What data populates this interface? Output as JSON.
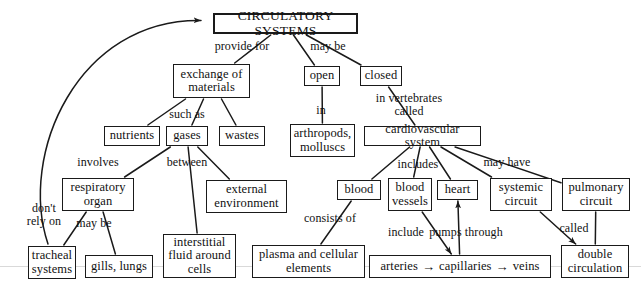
{
  "diagram": {
    "title": "CIRCULATORY SYSTEMS",
    "type": "concept-map",
    "background_color": "#ffffff",
    "line_color": "#1a1a1a",
    "text_color": "#111111"
  },
  "nodes": [
    {
      "id": "circulatory_systems",
      "label": "CIRCULATORY SYSTEMS",
      "x": 213,
      "y": 13,
      "w": 145,
      "h": 21,
      "font": 13.5,
      "title": true
    },
    {
      "id": "exchange_of_materials",
      "label": "exchange of\nmaterials",
      "x": 173,
      "y": 64,
      "w": 77,
      "h": 34,
      "font": 12.5
    },
    {
      "id": "open",
      "label": "open",
      "x": 304,
      "y": 66,
      "w": 36,
      "h": 20,
      "font": 12.5
    },
    {
      "id": "closed",
      "label": "closed",
      "x": 360,
      "y": 66,
      "w": 42,
      "h": 20,
      "font": 12.5
    },
    {
      "id": "nutrients",
      "label": "nutrients",
      "x": 104,
      "y": 126,
      "w": 56,
      "h": 20,
      "font": 12.5
    },
    {
      "id": "gases",
      "label": "gases",
      "x": 166,
      "y": 126,
      "w": 42,
      "h": 20,
      "font": 12.5
    },
    {
      "id": "wastes",
      "label": "wastes",
      "x": 219,
      "y": 126,
      "w": 46,
      "h": 20,
      "font": 12.5
    },
    {
      "id": "arthropods_molluscs",
      "label": "arthropods,\nmolluscs",
      "x": 290,
      "y": 124,
      "w": 65,
      "h": 33,
      "font": 12.5
    },
    {
      "id": "cardiovascular_system",
      "label": "cardiovascular system",
      "x": 364,
      "y": 126,
      "w": 117,
      "h": 20,
      "font": 12.5
    },
    {
      "id": "respiratory_organ",
      "label": "respiratory\norgan",
      "x": 62,
      "y": 178,
      "w": 72,
      "h": 33,
      "font": 12.5
    },
    {
      "id": "external_environment",
      "label": "external\nenvironment",
      "x": 206,
      "y": 180,
      "w": 81,
      "h": 33,
      "font": 12.5
    },
    {
      "id": "blood",
      "label": "blood",
      "x": 337,
      "y": 180,
      "w": 44,
      "h": 20,
      "font": 12.5
    },
    {
      "id": "blood_vessels",
      "label": "blood\nvessels",
      "x": 388,
      "y": 178,
      "w": 44,
      "h": 33,
      "font": 12.5
    },
    {
      "id": "heart",
      "label": "heart",
      "x": 437,
      "y": 180,
      "w": 41,
      "h": 20,
      "font": 12.5
    },
    {
      "id": "systemic_circuit",
      "label": "systemic\ncircuit",
      "x": 490,
      "y": 178,
      "w": 62,
      "h": 33,
      "font": 12.5
    },
    {
      "id": "pulmonary_circuit",
      "label": "pulmonary\ncircuit",
      "x": 562,
      "y": 178,
      "w": 68,
      "h": 33,
      "font": 12.5
    },
    {
      "id": "tracheal_systems",
      "label": "tracheal\nsystems",
      "x": 28,
      "y": 246,
      "w": 48,
      "h": 33,
      "font": 12.5
    },
    {
      "id": "gills_lungs",
      "label": "gills, lungs",
      "x": 85,
      "y": 255,
      "w": 68,
      "h": 23,
      "font": 12.5
    },
    {
      "id": "interstitial_fluid",
      "label": "interstitial\nfluid around\ncells",
      "x": 163,
      "y": 234,
      "w": 73,
      "h": 44,
      "font": 12.5
    },
    {
      "id": "plasma_cellular_elements",
      "label": "plasma and cellular\nelements",
      "x": 252,
      "y": 245,
      "w": 113,
      "h": 33,
      "font": 12.5
    },
    {
      "id": "double_circulation",
      "label": "double\ncirculation",
      "x": 561,
      "y": 245,
      "w": 68,
      "h": 33,
      "font": 12.5
    }
  ],
  "chain_node": {
    "id": "arteries_capillaries_veins",
    "x": 369,
    "y": 255,
    "w": 182,
    "h": 23,
    "font": 12.5,
    "parts": [
      "arteries",
      "capillaries",
      "veins"
    ],
    "arrow_glyph": "→"
  },
  "link_labels": [
    {
      "id": "provide_for",
      "text": "provide for",
      "x": 206,
      "y": 40,
      "w": 72
    },
    {
      "id": "may_be_top",
      "text": "may be",
      "x": 303,
      "y": 40,
      "w": 50
    },
    {
      "id": "in",
      "text": "in",
      "x": 311,
      "y": 104,
      "w": 20
    },
    {
      "id": "in_vertebrates_called",
      "text": "in vertebrates\ncalled",
      "x": 366,
      "y": 92,
      "w": 86
    },
    {
      "id": "such_as",
      "text": "such as",
      "x": 163,
      "y": 108,
      "w": 48
    },
    {
      "id": "involves",
      "text": "involves",
      "x": 71,
      "y": 156,
      "w": 54
    },
    {
      "id": "between",
      "text": "between",
      "x": 160,
      "y": 156,
      "w": 54
    },
    {
      "id": "includes",
      "text": "includes",
      "x": 392,
      "y": 158,
      "w": 52
    },
    {
      "id": "may_have",
      "text": "may have",
      "x": 477,
      "y": 156,
      "w": 60
    },
    {
      "id": "dont_rely_on",
      "text": "don't\nrely on",
      "x": 20,
      "y": 202,
      "w": 48
    },
    {
      "id": "may_be_left",
      "text": "may be",
      "x": 70,
      "y": 217,
      "w": 48
    },
    {
      "id": "consists_of",
      "text": "consists of",
      "x": 297,
      "y": 212,
      "w": 66
    },
    {
      "id": "include",
      "text": "include",
      "x": 382,
      "y": 226,
      "w": 48
    },
    {
      "id": "pumps_through",
      "text": "pumps through",
      "x": 420,
      "y": 226,
      "w": 92
    },
    {
      "id": "called_bottom",
      "text": "called",
      "x": 553,
      "y": 222,
      "w": 42
    }
  ],
  "edges": [
    {
      "id": "circulatory-to-exchange",
      "from": "circulatory_systems",
      "to": "exchange_of_materials",
      "arrow": false
    },
    {
      "id": "circulatory-to-open",
      "from": "circulatory_systems",
      "to": "open",
      "arrow": false
    },
    {
      "id": "circulatory-to-closed",
      "from": "circulatory_systems",
      "to": "closed",
      "arrow": false
    },
    {
      "id": "open-to-arthropods",
      "from": "open",
      "to": "arthropods_molluscs",
      "arrow": false
    },
    {
      "id": "closed-to-cardiovascular",
      "from": "closed",
      "to": "cardiovascular_system",
      "arrow": false
    },
    {
      "id": "exchange-to-nutrients",
      "from": "exchange_of_materials",
      "to": "nutrients",
      "arrow": false
    },
    {
      "id": "exchange-to-gases",
      "from": "exchange_of_materials",
      "to": "gases",
      "arrow": false
    },
    {
      "id": "exchange-to-wastes",
      "from": "exchange_of_materials",
      "to": "wastes",
      "arrow": false
    },
    {
      "id": "gases-to-respiratory-organ",
      "from": "gases",
      "to": "respiratory_organ",
      "arrow": false
    },
    {
      "id": "gases-to-external-environment",
      "from": "gases",
      "to": "external_environment",
      "arrow": false
    },
    {
      "id": "gases-to-interstitial-fluid",
      "from": "gases",
      "to": "interstitial_fluid",
      "arrow": false
    },
    {
      "id": "respiratory-to-tracheal",
      "from": "respiratory_organ",
      "to": "tracheal_systems",
      "arrow": false
    },
    {
      "id": "respiratory-to-gills-lungs",
      "from": "respiratory_organ",
      "to": "gills_lungs",
      "arrow": false
    },
    {
      "id": "tracheal-to-circulatory-curve",
      "from": "tracheal_systems",
      "to": "circulatory_systems",
      "arrow": true,
      "curved": true
    },
    {
      "id": "cardiovascular-to-blood",
      "from": "cardiovascular_system",
      "to": "blood",
      "arrow": false
    },
    {
      "id": "cardiovascular-to-blood-vessels",
      "from": "cardiovascular_system",
      "to": "blood_vessels",
      "arrow": false
    },
    {
      "id": "cardiovascular-to-heart",
      "from": "cardiovascular_system",
      "to": "heart",
      "arrow": false
    },
    {
      "id": "cardiovascular-to-systemic",
      "from": "cardiovascular_system",
      "to": "systemic_circuit",
      "arrow": false
    },
    {
      "id": "cardiovascular-to-pulmonary",
      "from": "cardiovascular_system",
      "to": "pulmonary_circuit",
      "arrow": false
    },
    {
      "id": "blood-to-plasma",
      "from": "blood",
      "to": "plasma_cellular_elements",
      "arrow": false
    },
    {
      "id": "blood-vessels-to-arteries",
      "from": "blood_vessels",
      "to": "arteries_capillaries_veins",
      "arrow": true
    },
    {
      "id": "arteries-to-heart",
      "from": "arteries_capillaries_veins",
      "to": "heart",
      "arrow": true
    },
    {
      "id": "systemic-to-double-circulation",
      "from": "systemic_circuit",
      "to": "double_circulation",
      "arrow": true
    },
    {
      "id": "pulmonary-to-double-circulation",
      "from": "pulmonary_circuit",
      "to": "double_circulation",
      "arrow": false
    }
  ],
  "artifacts": {
    "scan_line_y": 266,
    "scan_line_color": "#d9d9d9"
  }
}
